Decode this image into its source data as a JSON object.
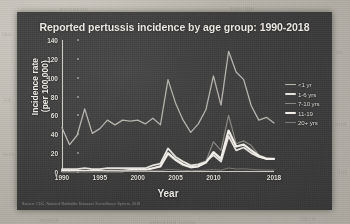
{
  "slide": {
    "title": "Reported pertussis incidence by age group: 1990-2018",
    "source_note": "Source: CDC, National Notifiable Diseases Surveillance System, 2018",
    "panel_color": "#3e3e3e",
    "text_color": "#ece9e4",
    "paper_color": "#b9b5ac"
  },
  "ghost_marks": [
    {
      "text": "the",
      "x": 2,
      "y": 30
    },
    {
      "text": "in",
      "x": 336,
      "y": 48
    },
    {
      "text": "of",
      "x": 4,
      "y": 96
    },
    {
      "text": "and",
      "x": 335,
      "y": 120
    },
    {
      "text": "was",
      "x": 3,
      "y": 150
    },
    {
      "text": "for",
      "x": 338,
      "y": 168
    },
    {
      "text": "health",
      "x": 40,
      "y": 216
    },
    {
      "text": "reported cases",
      "x": 150,
      "y": 218
    },
    {
      "text": "2018",
      "x": 300,
      "y": 215
    },
    {
      "text": "pertussis",
      "x": 60,
      "y": 5
    },
    {
      "text": "vaccine",
      "x": 230,
      "y": 4
    }
  ],
  "chart_data": {
    "type": "line",
    "title": "Reported pertussis incidence by age group: 1990-2018",
    "xlabel": "Year",
    "ylabel": "Incidence rate (per 100,000)",
    "ylabel_lines": [
      "Incidence rate",
      "(per 100,000)"
    ],
    "xlim": [
      1990,
      2018
    ],
    "ylim": [
      0,
      140
    ],
    "yticks": [
      0,
      20,
      40,
      60,
      80,
      100,
      120,
      140
    ],
    "xticks": [
      1990,
      1995,
      2000,
      2005,
      2010,
      2018
    ],
    "grid": false,
    "legend_position": "right",
    "x": [
      1990,
      1991,
      1992,
      1993,
      1994,
      1995,
      1996,
      1997,
      1998,
      1999,
      2000,
      2001,
      2002,
      2003,
      2004,
      2005,
      2006,
      2007,
      2008,
      2009,
      2010,
      2011,
      2012,
      2013,
      2014,
      2015,
      2016,
      2017,
      2018
    ],
    "series": [
      {
        "name": "<1 yr",
        "color": "#b9b6b0",
        "width": 1.3,
        "values": [
          47,
          29,
          39,
          67,
          41,
          46,
          55,
          50,
          55,
          54,
          55,
          51,
          57,
          50,
          98,
          73,
          55,
          42,
          51,
          66,
          102,
          71,
          128,
          106,
          98,
          70,
          55,
          58,
          52
        ]
      },
      {
        "name": "1-6 yrs",
        "color": "#e6e3de",
        "width": 1.8,
        "values": [
          3,
          3,
          3,
          4,
          3,
          3,
          4,
          4,
          4,
          4,
          4,
          4,
          7,
          9,
          25,
          16,
          11,
          7,
          8,
          11,
          18,
          11,
          38,
          23,
          26,
          20,
          16,
          14,
          14
        ]
      },
      {
        "name": "7-10 yrs",
        "color": "#8e8b86",
        "width": 1.2,
        "values": [
          1,
          1,
          1,
          1,
          1,
          1,
          1,
          1,
          2,
          2,
          2,
          2,
          4,
          6,
          18,
          12,
          7,
          5,
          6,
          11,
          32,
          23,
          60,
          30,
          33,
          28,
          18,
          15,
          14
        ]
      },
      {
        "name": "11-19",
        "color": "#f2efea",
        "width": 2.2,
        "values": [
          1,
          1,
          1,
          1,
          1,
          1,
          1,
          1,
          1,
          2,
          2,
          2,
          4,
          6,
          20,
          13,
          8,
          5,
          6,
          10,
          21,
          14,
          44,
          27,
          29,
          23,
          17,
          14,
          14
        ]
      },
      {
        "name": "20+ yrs",
        "color": "#7d7a76",
        "width": 1.0,
        "values": [
          0.3,
          0.3,
          0.4,
          0.5,
          0.5,
          0.5,
          0.8,
          0.8,
          0.9,
          1.0,
          1.2,
          1.2,
          1.6,
          1.8,
          2.8,
          2.3,
          1.8,
          1.4,
          1.6,
          2.0,
          2.6,
          2.0,
          4.2,
          3.1,
          3.3,
          2.8,
          2.3,
          2.1,
          2.1
        ]
      }
    ]
  }
}
